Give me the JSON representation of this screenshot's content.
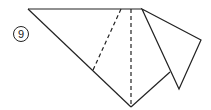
{
  "diagram": {
    "step_number": "9",
    "colors": {
      "line": "#222222",
      "background": "#ffffff"
    },
    "solid_edges": [
      [
        [
          28,
          9
        ],
        [
          142,
          9
        ]
      ],
      [
        [
          28,
          9
        ],
        [
          131,
          107
        ]
      ],
      [
        [
          131,
          107
        ],
        [
          170,
          72
        ]
      ],
      [
        [
          142,
          9
        ],
        [
          201,
          40
        ]
      ],
      [
        [
          201,
          40
        ],
        [
          179,
          89
        ]
      ],
      [
        [
          179,
          89
        ],
        [
          142,
          9
        ]
      ]
    ],
    "dashed_folds": [
      [
        [
          121,
          9
        ],
        [
          93,
          70
        ]
      ],
      [
        [
          131,
          9
        ],
        [
          131,
          107
        ]
      ]
    ]
  }
}
